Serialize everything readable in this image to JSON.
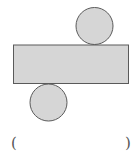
{
  "figure": {
    "colors": {
      "fill": "#d6d6d6",
      "stroke": "#5a5a5a"
    },
    "top_circle": {
      "cx": 94.5,
      "cy": 26,
      "r": 18.5
    },
    "rectangle": {
      "x": 13.5,
      "y": 45,
      "width": 115,
      "height": 38.5
    },
    "bottom_circle": {
      "cx": 48.5,
      "cy": 102.5,
      "r": 18.5
    }
  },
  "answer": {
    "open_paren": "(",
    "close_paren": ")",
    "blank": ""
  }
}
